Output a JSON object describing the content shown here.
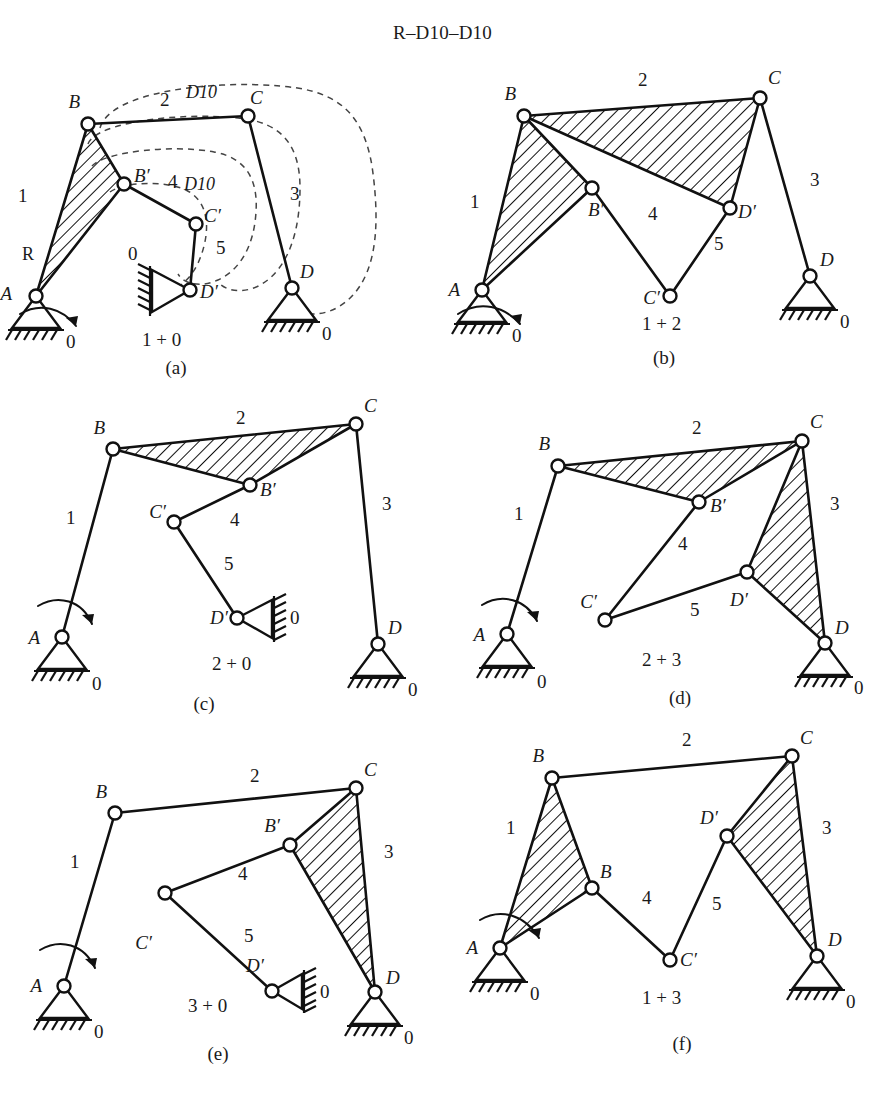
{
  "title": "R–D10–D10",
  "panels": [
    {
      "id": "a",
      "caption": "(a)",
      "group_label": "1 + 0",
      "joint_labels": {
        "A": "A",
        "B": "B",
        "Bp": "B′",
        "C": "C",
        "Cp": "C′",
        "D": "D",
        "Dp": "D′"
      },
      "link_numbers": {
        "l1": "1",
        "l2": "2",
        "l3": "3",
        "l4": "4",
        "l5": "5"
      },
      "ground_labels": {
        "g_left": "0",
        "g_right": "0",
        "g_mid": "0"
      },
      "annotations": {
        "input": "R",
        "dyad_top": "D10",
        "dyad_mid": "D10"
      }
    },
    {
      "id": "b",
      "caption": "(b)",
      "group_label": "1 + 2",
      "joint_labels": {
        "A": "A",
        "B": "B",
        "Bp": "B′",
        "C": "C",
        "Cp": "C′",
        "D": "D",
        "Dp": "D′"
      },
      "link_numbers": {
        "l1": "1",
        "l2": "2",
        "l3": "3",
        "l4": "4",
        "l5": "5"
      },
      "ground_labels": {
        "g_left": "0",
        "g_right": "0"
      }
    },
    {
      "id": "c",
      "caption": "(c)",
      "group_label": "2 + 0",
      "joint_labels": {
        "A": "A",
        "B": "B",
        "Bp": "B′",
        "C": "C",
        "Cp": "C′",
        "D": "D",
        "Dp": "D′"
      },
      "link_numbers": {
        "l1": "1",
        "l2": "2",
        "l3": "3",
        "l4": "4",
        "l5": "5"
      },
      "ground_labels": {
        "g_left": "0",
        "g_right": "0",
        "g_mid": "0"
      }
    },
    {
      "id": "d",
      "caption": "(d)",
      "group_label": "2 + 3",
      "joint_labels": {
        "A": "A",
        "B": "B",
        "Bp": "B′",
        "C": "C",
        "Cp": "C′",
        "D": "D",
        "Dp": "D′"
      },
      "link_numbers": {
        "l1": "1",
        "l2": "2",
        "l3": "3",
        "l4": "4",
        "l5": "5"
      },
      "ground_labels": {
        "g_left": "0",
        "g_right": "0"
      }
    },
    {
      "id": "e",
      "caption": "(e)",
      "group_label": "3 + 0",
      "joint_labels": {
        "A": "A",
        "B": "B",
        "Bp": "B′",
        "C": "C",
        "Cp": "C′",
        "D": "D",
        "Dp": "D′"
      },
      "link_numbers": {
        "l1": "1",
        "l2": "2",
        "l3": "3",
        "l4": "4",
        "l5": "5"
      },
      "ground_labels": {
        "g_left": "0",
        "g_right": "0",
        "g_mid": "0"
      }
    },
    {
      "id": "f",
      "caption": "(f)",
      "group_label": "1 + 3",
      "joint_labels": {
        "A": "A",
        "B": "B",
        "Bp": "B",
        "C": "C",
        "Cp": "C′",
        "D": "D",
        "Dp": "D′"
      },
      "link_numbers": {
        "l1": "1",
        "l2": "2",
        "l3": "3",
        "l4": "4",
        "l5": "5"
      },
      "ground_labels": {
        "g_left": "0",
        "g_right": "0"
      }
    }
  ],
  "colors": {
    "ink": "#1a1a1a",
    "stroke": "#111111",
    "dashed": "#444444",
    "paper": "#ffffff"
  }
}
